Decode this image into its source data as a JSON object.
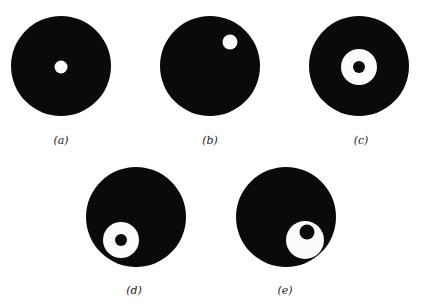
{
  "figure": {
    "colors": {
      "disc": "#0a0a0a",
      "hole": "#fbfbfb",
      "background": "#ffffff"
    },
    "panels": [
      {
        "id": "a",
        "caption": "(a)",
        "description": "black disc with small centered white hole"
      },
      {
        "id": "b",
        "caption": "(b)",
        "description": "black disc with small white hole offset toward upper-right"
      },
      {
        "id": "c",
        "caption": "(c)",
        "description": "black disc with centered white annulus containing a black core"
      },
      {
        "id": "d",
        "caption": "(d)",
        "description": "black disc with white annulus offset toward lower-left, black core centered in annulus"
      },
      {
        "id": "e",
        "caption": "(e)",
        "description": "black disc with white region offset toward lower-right, black core off-center toward upper-right within it"
      }
    ]
  }
}
